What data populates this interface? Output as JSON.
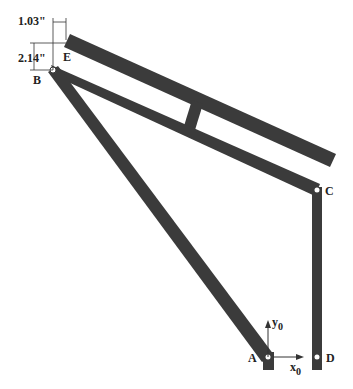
{
  "diagram": {
    "type": "linkage-mechanism",
    "colors": {
      "bar": "#3b3b3b",
      "pin": "#ffffff",
      "line": "#333333",
      "text": "#222222"
    },
    "points": {
      "A": {
        "label": "A",
        "x": 268,
        "y": 357
      },
      "B": {
        "label": "B",
        "x": 53,
        "y": 70
      },
      "C": {
        "label": "C",
        "x": 317,
        "y": 190
      },
      "D": {
        "label": "D",
        "x": 317,
        "y": 357
      },
      "E": {
        "label": "E",
        "x": 66,
        "y": 41
      }
    },
    "dimensions": {
      "horizontal": "1.03\"",
      "vertical": "2.14\""
    },
    "axes": {
      "x_label": "x",
      "x_sub": "0",
      "y_label": "y",
      "y_sub": "0"
    }
  }
}
